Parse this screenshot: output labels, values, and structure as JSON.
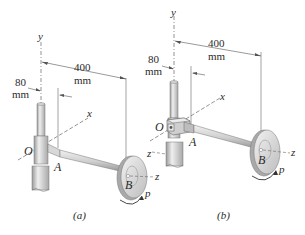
{
  "figure": {
    "panels": [
      {
        "id": "a",
        "caption": "(a)",
        "axes": {
          "y": "y",
          "x": "x",
          "z": "z"
        },
        "points": {
          "origin": "O",
          "A": "A",
          "B": "B"
        },
        "rotation_label": "p",
        "dimensions": {
          "offset": {
            "value": "80",
            "unit": "mm"
          },
          "length": {
            "value": "400",
            "unit": "mm"
          }
        }
      },
      {
        "id": "b",
        "caption": "(b)",
        "axes": {
          "y": "y",
          "x": "x",
          "z": "z"
        },
        "points": {
          "origin": "O",
          "A": "A",
          "B": "B"
        },
        "rotation_label": "p",
        "dimensions": {
          "offset": {
            "value": "80",
            "unit": "mm"
          },
          "length": {
            "value": "400",
            "unit": "mm"
          }
        }
      }
    ],
    "colors": {
      "metal_light": "#e6e6e6",
      "metal_mid": "#c8c8c8",
      "metal_dark": "#8f8f8f",
      "line": "#555555",
      "text": "#2a2a2a"
    }
  }
}
